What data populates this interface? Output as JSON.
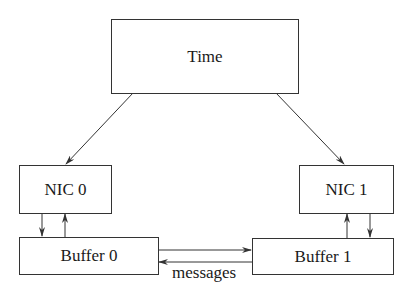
{
  "nodes": {
    "time": {
      "label": "Time"
    },
    "nic0": {
      "label": "NIC 0"
    },
    "nic1": {
      "label": "NIC 1"
    },
    "buffer0": {
      "label": "Buffer 0"
    },
    "buffer1": {
      "label": "Buffer 1"
    }
  },
  "edges": {
    "messages_label": "messages"
  },
  "colors": {
    "stroke": "#333333",
    "text": "#1a1a1a",
    "background": "#ffffff"
  }
}
